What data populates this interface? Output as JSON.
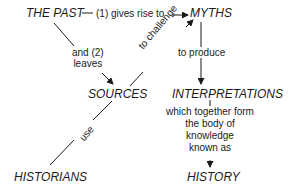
{
  "nodes": {
    "past": "THE PAST",
    "myths": "MYTHS",
    "sources": "SOURCES",
    "interpretations": "INTERPRETATIONS",
    "historians": "HISTORIANS",
    "history": "HISTORY"
  },
  "edges": {
    "past_myths": "(1) gives rise to",
    "past_sources": [
      "and (2)",
      "leaves"
    ],
    "sources_myths": "to challenge",
    "myths_interpretations": "to produce",
    "historians_sources": "use",
    "interpretations_history": [
      "which together form",
      "the body of",
      "knowledge",
      "known as"
    ]
  }
}
